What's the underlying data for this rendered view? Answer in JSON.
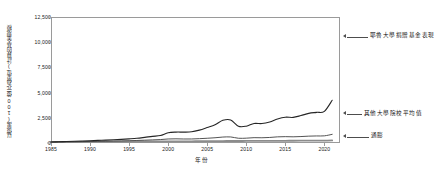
{
  "chart_data": {
    "type": "line",
    "title": "",
    "xlabel": "年份",
    "ylabel": "以億萬(100億元為單位)計算的基金規模",
    "xlim": [
      1985,
      2022
    ],
    "ylim": [
      0,
      12500
    ],
    "grid": false,
    "legend_position": "right-annotations",
    "ytick_labels": [
      "12,500",
      "10,000",
      "7,500",
      "5,000",
      "2,500",
      "0"
    ],
    "ytick_values": [
      12500,
      10000,
      7500,
      5000,
      2500,
      0
    ],
    "xtick_labels": [
      "1985",
      "1990",
      "1995",
      "2000",
      "2005",
      "2010",
      "2015",
      "2020"
    ],
    "xtick_values": [
      1985,
      1990,
      1995,
      2000,
      2005,
      2010,
      2015,
      2020
    ],
    "x": [
      1985,
      1986,
      1987,
      1988,
      1989,
      1990,
      1991,
      1992,
      1993,
      1994,
      1995,
      1996,
      1997,
      1998,
      1999,
      2000,
      2001,
      2002,
      2003,
      2004,
      2005,
      2006,
      2007,
      2008,
      2009,
      2010,
      2011,
      2012,
      2013,
      2014,
      2015,
      2016,
      2017,
      2018,
      2019,
      2020,
      2021
    ],
    "series": [
      {
        "name": "耶魯大學捐贈基金表現",
        "color": "#262626",
        "width": 1.1,
        "annotation": "耶魯大學捐贈基金表現",
        "values": [
          100,
          120,
          150,
          175,
          200,
          230,
          260,
          285,
          320,
          360,
          410,
          470,
          560,
          660,
          740,
          1010,
          1080,
          1080,
          1110,
          1280,
          1530,
          1800,
          2250,
          2290,
          1660,
          1670,
          1940,
          1930,
          2090,
          2390,
          2560,
          2540,
          2720,
          2940,
          3040,
          3140,
          4240
        ]
      },
      {
        "name": "其他大學院校平均值",
        "color": "#404040",
        "width": 0.9,
        "annotation": "其他大學院校平均值",
        "values": [
          95,
          105,
          115,
          125,
          140,
          155,
          168,
          180,
          195,
          210,
          228,
          250,
          280,
          310,
          340,
          400,
          415,
          398,
          400,
          430,
          470,
          520,
          590,
          600,
          470,
          480,
          530,
          520,
          550,
          610,
          630,
          615,
          640,
          680,
          700,
          710,
          860
        ]
      },
      {
        "name": "通膨",
        "color": "#8c8c8c",
        "width": 1.8,
        "annotation": "通膨",
        "values": [
          100,
          102,
          106,
          110,
          116,
          122,
          127,
          131,
          135,
          138,
          142,
          146,
          149,
          152,
          155,
          160,
          165,
          167,
          171,
          176,
          182,
          187,
          193,
          200,
          199,
          203,
          209,
          213,
          216,
          220,
          220,
          223,
          228,
          233,
          237,
          240,
          251
        ]
      }
    ],
    "annotations": [
      {
        "name": "yale-annotation",
        "text": "耶魯大學捐贈基金表現"
      },
      {
        "name": "average-annotation",
        "text": "其他大學院校平均值"
      },
      {
        "name": "inflation-annotation",
        "text": "通膨"
      }
    ],
    "axis_color": "#9a9a9a"
  }
}
